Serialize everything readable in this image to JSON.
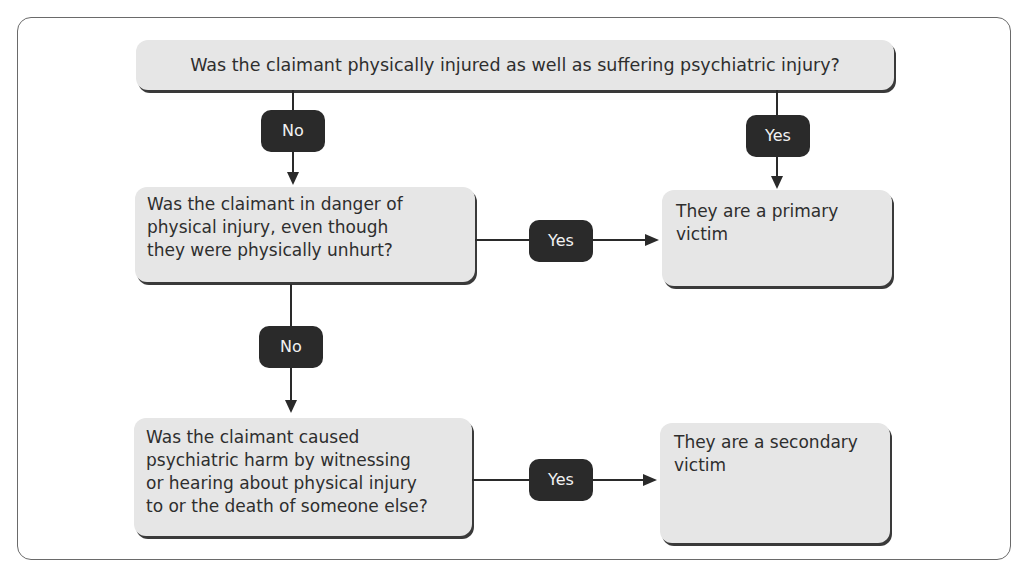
{
  "diagram": {
    "type": "flowchart",
    "nodes": {
      "q1": "Was the claimant physically injured as well as suffering psychiatric injury?",
      "q2": [
        "Was the claimant in danger of",
        "physical injury, even though",
        "they were physically unhurt?"
      ],
      "q3": [
        "Was the claimant caused",
        "psychiatric harm by witnessing",
        "or hearing about physical injury",
        "to or the death of someone else?"
      ],
      "r1": [
        "They are a primary",
        "victim"
      ],
      "r2": [
        "They are a secondary",
        "victim"
      ]
    },
    "edges": {
      "q1_no": "No",
      "q1_yes": "Yes",
      "q2_yes": "Yes",
      "q2_no": "No",
      "q3_yes": "Yes"
    },
    "colors": {
      "box_fill": "#e6e6e6",
      "label_fill": "#2a2a2a",
      "label_text": "#f2f2f2",
      "line": "#2a2a2a"
    }
  }
}
